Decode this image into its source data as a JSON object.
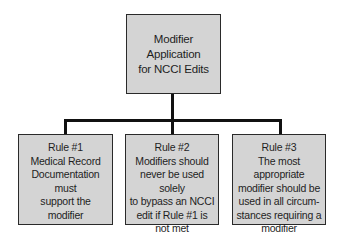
{
  "diagram": {
    "type": "hierarchy",
    "root": {
      "lines": [
        "Modifier Application",
        "for NCCI Edits"
      ]
    },
    "children": [
      {
        "title": "Rule #1",
        "lines": [
          "Medical Record",
          "Documentation must",
          "support the modifier"
        ]
      },
      {
        "title": "Rule #2",
        "lines": [
          "Modifiers should",
          "never be used solely",
          "to bypass an NCCI",
          "edit if Rule #1 is",
          "not met"
        ]
      },
      {
        "title": "Rule #3",
        "lines": [
          "The most appropriate",
          "modifier should be",
          "used in all circum-",
          "stances requiring a",
          "modifier"
        ]
      }
    ],
    "colors": {
      "box_fill": "#d4d4d4",
      "box_border": "#2a2a2a",
      "connector": "#111111",
      "background": "#ffffff"
    }
  }
}
